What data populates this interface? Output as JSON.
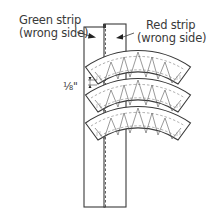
{
  "diagram": {
    "labels": {
      "green_strip_line1": "Green strip",
      "green_strip_line2": "(wrong side)",
      "red_strip_line1": "Red strip",
      "red_strip_line2": "(wrong side)",
      "seam_allowance": "⅛\""
    },
    "arc_count": 3,
    "colors": {
      "line": "#3a3a3a",
      "fill": "#ffffff"
    }
  }
}
